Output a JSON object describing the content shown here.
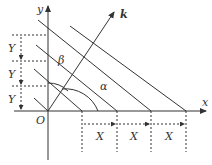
{
  "diagram": {
    "axes": {
      "x_label": "x",
      "y_label": "y",
      "origin_label": "O"
    },
    "vector_label": "k",
    "angles": {
      "alpha": "α",
      "beta": "β"
    },
    "spacing_labels": {
      "y": [
        "Y",
        "Y",
        "Y"
      ],
      "x": [
        "X",
        "X",
        "X"
      ]
    },
    "line_color": "#333333"
  }
}
